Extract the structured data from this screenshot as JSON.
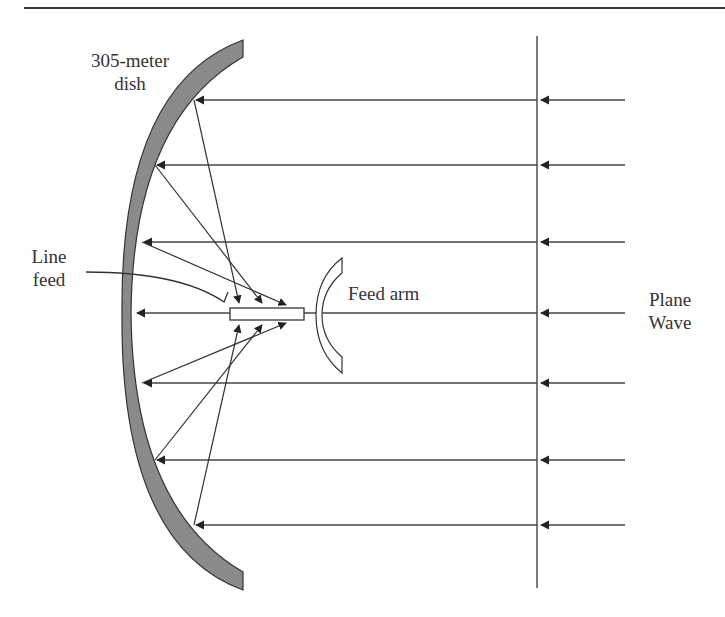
{
  "figure": {
    "labels": {
      "dish_line1": "305-meter",
      "dish_line2": "dish",
      "line_feed_line1": "Line",
      "line_feed_line2": "feed",
      "feed_arm": "Feed arm",
      "plane_wave_line1": "Plane",
      "plane_wave_line2": "Wave"
    },
    "colors": {
      "dish_fill": "#8a8a8a",
      "line": "#333333",
      "background": "#ffffff"
    },
    "incoming_rays_y": [
      100,
      165,
      242,
      313,
      383,
      460,
      525
    ]
  }
}
